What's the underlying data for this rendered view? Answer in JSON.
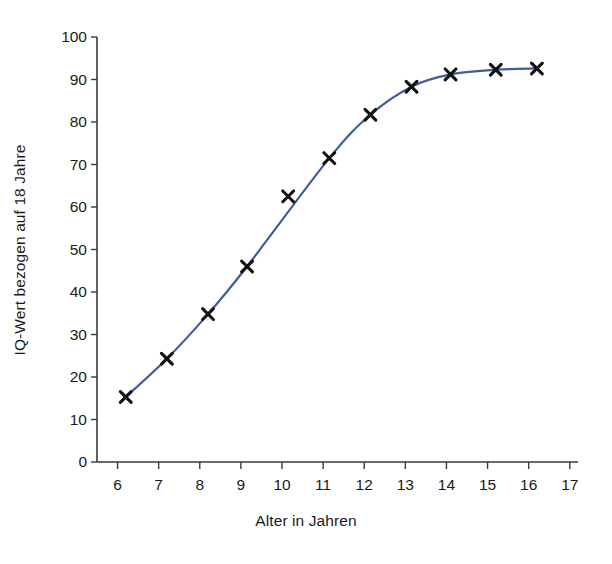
{
  "chart_data": {
    "type": "line",
    "title": "",
    "subtitle": "",
    "xlabel": "Alter in Jahren",
    "ylabel": "IQ-Wert bezogen auf 18 Jahre",
    "xlim": [
      5.5,
      17.2
    ],
    "ylim": [
      0,
      100
    ],
    "xticks": [
      6,
      7,
      8,
      9,
      10,
      11,
      12,
      13,
      14,
      15,
      16,
      17
    ],
    "xtick_labels": [
      "6",
      "7",
      "8",
      "9",
      "10",
      "11",
      "12",
      "13",
      "14",
      "15",
      "16",
      "17"
    ],
    "yticks": [
      0,
      10,
      20,
      30,
      40,
      50,
      60,
      70,
      80,
      90,
      100
    ],
    "ytick_labels": [
      "0",
      "10",
      "20",
      "30",
      "40",
      "50",
      "60",
      "70",
      "80",
      "90",
      "100"
    ],
    "grid": false,
    "legend": null,
    "legend_position": "none",
    "marker": "x",
    "marker_color": "#111111",
    "line_color": "#3f5d9e",
    "line_width": 2.2,
    "x": [
      6.2,
      7.2,
      8.2,
      9.15,
      10.15,
      11.15,
      12.15,
      13.15,
      14.1,
      15.2,
      16.2
    ],
    "y": [
      15.3,
      24.3,
      34.8,
      46.0,
      62.5,
      71.5,
      81.7,
      88.3,
      91.2,
      92.3,
      92.6
    ],
    "points": [
      {
        "age": 6.2,
        "iq": 15.3
      },
      {
        "age": 7.2,
        "iq": 24.3
      },
      {
        "age": 8.2,
        "iq": 34.8
      },
      {
        "age": 9.15,
        "iq": 46.0
      },
      {
        "age": 10.15,
        "iq": 62.5
      },
      {
        "age": 11.15,
        "iq": 71.5
      },
      {
        "age": 12.15,
        "iq": 81.7
      },
      {
        "age": 13.15,
        "iq": 88.3
      },
      {
        "age": 14.1,
        "iq": 91.2
      },
      {
        "age": 15.2,
        "iq": 92.3
      },
      {
        "age": 16.2,
        "iq": 92.6
      }
    ],
    "line_path_x": [
      6.2,
      7.2,
      8.2,
      9.15,
      11.15,
      12.15,
      13.15,
      14.1,
      15.2,
      16.2
    ],
    "line_path_y": [
      15.3,
      24.3,
      34.8,
      46.0,
      71.5,
      81.7,
      88.3,
      91.2,
      92.3,
      92.6
    ],
    "annotations": []
  },
  "geometry": {
    "plot_left": 97,
    "plot_right": 578,
    "plot_top": 37,
    "plot_bottom": 462,
    "x_axis_min": 5.5,
    "x_axis_max": 17.2,
    "y_axis_min": 0,
    "y_axis_max": 100
  },
  "colors": {
    "line": "#3f5d9e",
    "marker": "#111111",
    "axis": "#3a3a3a",
    "text": "#1a1a1a",
    "background": "#ffffff"
  }
}
